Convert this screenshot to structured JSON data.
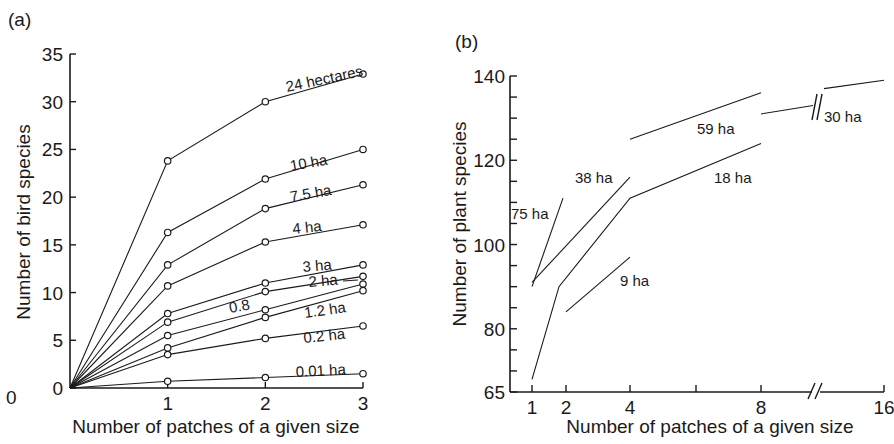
{
  "figure": {
    "panels": [
      {
        "id": "a",
        "panel_label": "(a)",
        "xlabel": "Number of patches of a given size",
        "ylabel": "Number of bird species",
        "x_ticks": [
          "0",
          "1",
          "2",
          "3"
        ],
        "y_ticks": [
          "0",
          "5",
          "10",
          "15",
          "20",
          "25",
          "30",
          "35"
        ]
      },
      {
        "id": "b",
        "panel_label": "(b)",
        "xlabel": "Number of patches of a given size",
        "ylabel": "Number of plant species",
        "x_ticks": [
          "1",
          "2",
          "4",
          "8",
          "16"
        ],
        "y_ticks": [
          "65",
          "80",
          "100",
          "120",
          "140"
        ]
      }
    ]
  },
  "chart_data": [
    {
      "type": "line",
      "title": "(a)",
      "xlabel": "Number of patches of a given size",
      "ylabel": "Number of bird species",
      "x": [
        0,
        1,
        2,
        3
      ],
      "xlim": [
        0,
        3
      ],
      "ylim": [
        0,
        35
      ],
      "y_ticks": [
        0,
        5,
        10,
        15,
        20,
        25,
        30,
        35
      ],
      "x_ticks": [
        1,
        2,
        3
      ],
      "grid": false,
      "legend": "inline labels next to line ends",
      "markers": "open circles",
      "series": [
        {
          "name": "24 hectares",
          "values": [
            0,
            23.8,
            30.0,
            32.9
          ]
        },
        {
          "name": "10 ha",
          "values": [
            0,
            16.3,
            21.9,
            25.0
          ]
        },
        {
          "name": "7.5 ha",
          "values": [
            0,
            12.9,
            18.8,
            21.3
          ]
        },
        {
          "name": "4 ha",
          "values": [
            0,
            10.7,
            15.3,
            17.1
          ]
        },
        {
          "name": "3 ha",
          "values": [
            0,
            7.8,
            11.0,
            12.9
          ]
        },
        {
          "name": "2 ha",
          "values": [
            0,
            6.9,
            10.1,
            11.7
          ]
        },
        {
          "name": "0.8",
          "values": [
            0,
            5.5,
            8.2,
            10.9
          ]
        },
        {
          "name": "1.2 ha",
          "values": [
            0,
            4.2,
            7.4,
            10.2
          ]
        },
        {
          "name": "0.2 ha",
          "values": [
            0,
            3.5,
            5.2,
            6.5
          ]
        },
        {
          "name": "0.01 ha",
          "values": [
            0,
            0.7,
            1.1,
            1.5
          ]
        }
      ]
    },
    {
      "type": "line",
      "title": "(b)",
      "xlabel": "Number of patches of a given size",
      "ylabel": "Number of plant species",
      "x_scale": "log2 (axis break between 8 and 16)",
      "x_ticks": [
        1,
        2,
        4,
        8,
        16
      ],
      "xlim": [
        1,
        16
      ],
      "ylim": [
        65,
        140
      ],
      "y_ticks": [
        65,
        80,
        100,
        120,
        140
      ],
      "y_minor_tick_step": 5,
      "grid": false,
      "legend": "inline labels next to lines",
      "series": [
        {
          "name": "75 ha",
          "x": [
            1,
            2
          ],
          "values": [
            90,
            111
          ]
        },
        {
          "name": "38 ha",
          "x": [
            1,
            4
          ],
          "values": [
            91,
            116
          ]
        },
        {
          "name": "18 ha",
          "x": [
            1,
            2,
            4,
            8
          ],
          "values": [
            68,
            90,
            111,
            124
          ]
        },
        {
          "name": "9 ha",
          "x": [
            2,
            4
          ],
          "values": [
            84,
            97
          ]
        },
        {
          "name": "59 ha",
          "x": [
            4,
            8
          ],
          "values": [
            125,
            136
          ]
        },
        {
          "name": "30 ha",
          "x": [
            8,
            11,
            12,
            16
          ],
          "values": [
            131,
            133,
            137,
            139
          ],
          "note": "line crosses axis break"
        }
      ]
    }
  ]
}
